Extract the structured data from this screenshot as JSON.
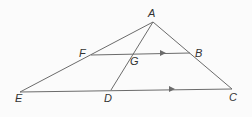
{
  "diagram": {
    "points": {
      "A": {
        "label": "A",
        "x": 153,
        "y": 22,
        "lx": 148,
        "ly": 17
      },
      "F": {
        "label": "F",
        "x": 91,
        "y": 55,
        "lx": 79,
        "ly": 57
      },
      "G": {
        "label": "G",
        "x": 134,
        "y": 54,
        "lx": 130,
        "ly": 65
      },
      "B": {
        "label": "B",
        "x": 190,
        "y": 53,
        "lx": 195,
        "ly": 57
      },
      "E": {
        "label": "E",
        "x": 20,
        "y": 92,
        "lx": 15,
        "ly": 102
      },
      "D": {
        "label": "D",
        "x": 111,
        "y": 90,
        "lx": 104,
        "ly": 102
      },
      "C": {
        "label": "C",
        "x": 232,
        "y": 89,
        "lx": 229,
        "ly": 101
      }
    },
    "segments": [
      [
        "A",
        "E"
      ],
      [
        "A",
        "C"
      ],
      [
        "A",
        "D"
      ],
      [
        "F",
        "B"
      ],
      [
        "E",
        "C"
      ]
    ],
    "parallel_marks": [
      {
        "on": "FB",
        "x": 163,
        "y": 53
      },
      {
        "on": "EC",
        "x": 172,
        "y": 89
      }
    ],
    "line_color": "#6b6b6b",
    "label_color": "#333333"
  }
}
